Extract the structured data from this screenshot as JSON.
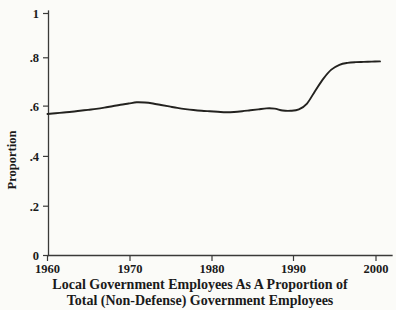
{
  "chart_data": {
    "type": "line",
    "title": "",
    "caption": [
      "Local Government Employees As A Proportion of",
      "Total (Non-Defense) Government Employees"
    ],
    "xlabel": "",
    "ylabel": "Proportion",
    "xlim": [
      1960,
      2001
    ],
    "ylim": [
      0,
      1
    ],
    "xticks": [
      1960,
      1970,
      1980,
      1990,
      2000
    ],
    "xtick_labels": [
      "1960",
      "1970",
      "1980",
      "1990",
      "2000"
    ],
    "yticks": [
      0,
      0.2,
      0.4,
      0.6,
      0.8,
      1
    ],
    "ytick_labels": [
      "0",
      ".2",
      ".4",
      ".6",
      ".8",
      "1"
    ],
    "grid": false,
    "legend": false,
    "line_color": "#23221f",
    "background_color": "#fbfbf8",
    "axis_color": "#3a3a38",
    "series": [
      {
        "name": "Local government share of non-defense government employees",
        "x": [
          1960,
          1961,
          1962,
          1963,
          1964,
          1965,
          1966,
          1967,
          1968,
          1969,
          1970,
          1971,
          1972,
          1973,
          1974,
          1975,
          1976,
          1977,
          1978,
          1979,
          1980,
          1981,
          1982,
          1983,
          1984,
          1985,
          1986,
          1987,
          1988,
          1989,
          1990,
          1991,
          1992,
          1993,
          1994,
          1995,
          1996,
          1997,
          1998,
          1999,
          2000,
          2001
        ],
        "values": [
          0.585,
          0.588,
          0.591,
          0.594,
          0.598,
          0.602,
          0.606,
          0.611,
          0.617,
          0.623,
          0.628,
          0.633,
          0.632,
          0.628,
          0.622,
          0.616,
          0.61,
          0.605,
          0.601,
          0.598,
          0.596,
          0.594,
          0.592,
          0.593,
          0.596,
          0.6,
          0.604,
          0.608,
          0.607,
          0.599,
          0.598,
          0.604,
          0.628,
          0.68,
          0.73,
          0.768,
          0.788,
          0.796,
          0.799,
          0.8,
          0.801,
          0.802
        ]
      }
    ],
    "annotations": {
      "peak_1971": 0.633,
      "trough_1982": 0.592,
      "bump_1987": 0.608,
      "plateau_2000": 0.801
    }
  },
  "axis": {
    "ylabel": "Proportion",
    "ytick_labels": [
      "1",
      ".8",
      ".6",
      ".4",
      ".2",
      "0"
    ],
    "xtick_labels": [
      "1960",
      "1970",
      "1980",
      "1990",
      "2000"
    ]
  },
  "caption": {
    "line1": "Local Government Employees As A Proportion of",
    "line2": "Total (Non-Defense) Government Employees"
  }
}
